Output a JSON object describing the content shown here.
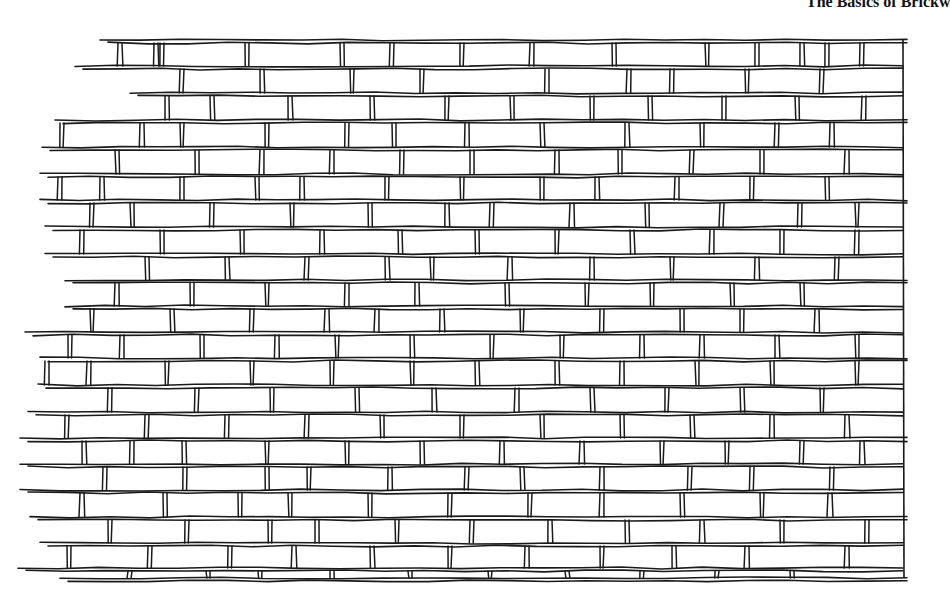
{
  "page": {
    "running_head": "The Basics of Brickw",
    "background": "#ffffff",
    "ink": "#1a1a1a"
  },
  "illustration": {
    "subject": "brick-wall-running-bond",
    "right_edge_x": 903,
    "top_y": 40,
    "bottom_y": 578,
    "courses": [
      {
        "y": 40,
        "x0": 100,
        "joints": [
          118,
          154,
          160,
          245,
          340,
          390,
          460,
          530,
          612,
          705,
          755,
          800,
          825,
          860
        ]
      },
      {
        "y": 66,
        "x0": 75,
        "joints": [
          180,
          260,
          350,
          420,
          545,
          627,
          670,
          745,
          820
        ]
      },
      {
        "y": 93,
        "x0": 130,
        "joints": [
          165,
          210,
          288,
          370,
          445,
          510,
          590,
          648,
          722,
          795,
          862
        ]
      },
      {
        "y": 120,
        "x0": 55,
        "joints": [
          60,
          140,
          180,
          265,
          345,
          392,
          465,
          540,
          625,
          700,
          775,
          830
        ]
      },
      {
        "y": 147,
        "x0": 42,
        "joints": [
          115,
          195,
          260,
          330,
          400,
          470,
          555,
          618,
          690,
          760,
          845
        ]
      },
      {
        "y": 174,
        "x0": 40,
        "joints": [
          58,
          100,
          180,
          255,
          300,
          385,
          460,
          540,
          595,
          675,
          750,
          825
        ]
      },
      {
        "y": 200,
        "x0": 40,
        "joints": [
          90,
          130,
          210,
          290,
          368,
          445,
          490,
          570,
          645,
          720,
          798,
          855
        ]
      },
      {
        "y": 227,
        "x0": 45,
        "joints": [
          80,
          160,
          240,
          320,
          398,
          475,
          555,
          630,
          710,
          780,
          855
        ]
      },
      {
        "y": 254,
        "x0": 45,
        "joints": [
          145,
          225,
          305,
          385,
          430,
          508,
          590,
          670,
          755,
          835
        ]
      },
      {
        "y": 280,
        "x0": 65,
        "joints": [
          115,
          190,
          265,
          345,
          415,
          505,
          585,
          650,
          730,
          800
        ]
      },
      {
        "y": 306,
        "x0": 65,
        "joints": [
          90,
          170,
          250,
          325,
          375,
          440,
          520,
          600,
          680,
          740,
          815
        ]
      },
      {
        "y": 332,
        "x0": 25,
        "joints": [
          68,
          120,
          200,
          275,
          335,
          410,
          490,
          560,
          640,
          700,
          775,
          855
        ]
      },
      {
        "y": 358,
        "x0": 40,
        "joints": [
          45,
          87,
          165,
          250,
          330,
          410,
          475,
          555,
          620,
          695,
          770,
          855
        ]
      },
      {
        "y": 385,
        "x0": 38,
        "joints": [
          108,
          195,
          270,
          355,
          432,
          515,
          590,
          665,
          740,
          820
        ]
      },
      {
        "y": 412,
        "x0": 28,
        "joints": [
          65,
          145,
          225,
          305,
          380,
          460,
          540,
          620,
          690,
          770,
          845
        ]
      },
      {
        "y": 438,
        "x0": 20,
        "joints": [
          82,
          130,
          182,
          265,
          345,
          420,
          500,
          580,
          660,
          725,
          800,
          860
        ]
      },
      {
        "y": 464,
        "x0": 20,
        "joints": [
          103,
          183,
          265,
          307,
          388,
          465,
          520,
          600,
          688,
          750,
          830
        ]
      },
      {
        "y": 490,
        "x0": 20,
        "joints": [
          80,
          163,
          238,
          288,
          368,
          448,
          528,
          600,
          680,
          760,
          828
        ]
      },
      {
        "y": 517,
        "x0": 30,
        "joints": [
          108,
          185,
          268,
          315,
          395,
          470,
          548,
          625,
          700,
          780,
          865
        ]
      },
      {
        "y": 543,
        "x0": 40,
        "joints": [
          67,
          148,
          228,
          292,
          370,
          448,
          525,
          600,
          672,
          745,
          845
        ]
      },
      {
        "y": 568,
        "x0": 18,
        "joints": [
          128,
          206,
          258,
          330,
          408,
          488,
          565,
          640,
          715,
          790
        ]
      },
      {
        "y": 578,
        "x0": 60,
        "joints": []
      }
    ]
  }
}
